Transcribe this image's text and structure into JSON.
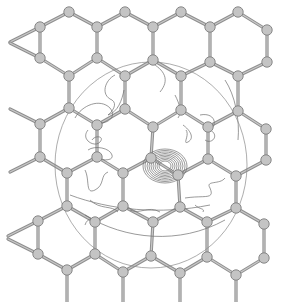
{
  "figure": {
    "colors": {
      "background": "#ffffff",
      "bond": "#8f8f8f",
      "atom_fill": "#c4c4c4",
      "atom_stroke": "#7e7e7e",
      "contour": "#6e6e6e"
    },
    "boundary_circle": {
      "cx": 151,
      "cy": 165,
      "rx": 96,
      "ry": 103
    },
    "defect_atoms": [
      {
        "x": 151,
        "y": 158
      },
      {
        "x": 178,
        "y": 175
      }
    ],
    "atoms": [
      [
        69,
        12
      ],
      [
        125,
        12
      ],
      [
        181,
        12
      ],
      [
        238,
        12
      ],
      [
        40,
        27
      ],
      [
        97,
        27
      ],
      [
        153,
        27
      ],
      [
        210,
        27
      ],
      [
        267,
        30
      ],
      [
        40,
        58
      ],
      [
        97,
        58
      ],
      [
        153,
        60
      ],
      [
        210,
        62
      ],
      [
        267,
        62
      ],
      [
        69,
        76
      ],
      [
        125,
        76
      ],
      [
        181,
        76
      ],
      [
        238,
        76
      ],
      [
        69,
        108
      ],
      [
        125,
        109
      ],
      [
        181,
        110
      ],
      [
        238,
        111
      ],
      [
        40,
        124
      ],
      [
        97,
        125
      ],
      [
        153,
        127
      ],
      [
        208,
        127
      ],
      [
        266,
        129
      ],
      [
        40,
        157
      ],
      [
        97,
        157
      ],
      [
        151,
        158
      ],
      [
        208,
        159
      ],
      [
        266,
        160
      ],
      [
        67,
        173
      ],
      [
        123,
        173
      ],
      [
        178,
        175
      ],
      [
        236,
        176
      ],
      [
        67,
        206
      ],
      [
        123,
        206
      ],
      [
        180,
        207
      ],
      [
        236,
        208
      ],
      [
        38,
        221
      ],
      [
        95,
        222
      ],
      [
        153,
        222
      ],
      [
        207,
        222
      ],
      [
        264,
        224
      ],
      [
        38,
        254
      ],
      [
        95,
        254
      ],
      [
        151,
        256
      ],
      [
        207,
        257
      ],
      [
        264,
        258
      ],
      [
        67,
        270
      ],
      [
        123,
        272
      ],
      [
        180,
        273
      ],
      [
        236,
        275
      ]
    ]
  }
}
